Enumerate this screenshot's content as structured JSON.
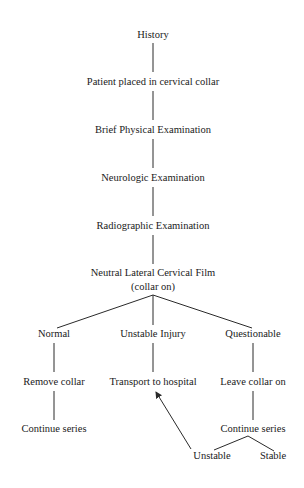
{
  "diagram": {
    "type": "flowchart",
    "nodes": {
      "history": "History",
      "collar": "Patient placed in cervical collar",
      "physical": "Brief Physical Examination",
      "neuro": "Neurologic Examination",
      "radio": "Radiographic Examination",
      "film_line1": "Neutral Lateral Cervical Film",
      "film_line2": "(collar on)",
      "normal": "Normal",
      "unstable_injury": "Unstable Injury",
      "questionable": "Questionable",
      "remove_collar": "Remove collar",
      "transport": "Transport to hospital",
      "leave_collar": "Leave collar on",
      "continue_left": "Continue series",
      "continue_right": "Continue series",
      "unstable": "Unstable",
      "stable": "Stable"
    },
    "edges": [
      [
        "History",
        "Patient placed in cervical collar"
      ],
      [
        "Patient placed in cervical collar",
        "Brief Physical Examination"
      ],
      [
        "Brief Physical Examination",
        "Neurologic Examination"
      ],
      [
        "Neurologic Examination",
        "Radiographic Examination"
      ],
      [
        "Radiographic Examination",
        "Neutral Lateral Cervical Film (collar on)"
      ],
      [
        "Neutral Lateral Cervical Film (collar on)",
        "Normal"
      ],
      [
        "Neutral Lateral Cervical Film (collar on)",
        "Unstable Injury"
      ],
      [
        "Neutral Lateral Cervical Film (collar on)",
        "Questionable"
      ],
      [
        "Normal",
        "Remove collar"
      ],
      [
        "Remove collar",
        "Continue series"
      ],
      [
        "Unstable Injury",
        "Transport to hospital"
      ],
      [
        "Questionable",
        "Leave collar on"
      ],
      [
        "Leave collar on",
        "Continue series"
      ],
      [
        "Continue series",
        "Unstable"
      ],
      [
        "Continue series",
        "Stable"
      ],
      [
        "Unstable",
        "Transport to hospital (arrow)"
      ]
    ]
  }
}
